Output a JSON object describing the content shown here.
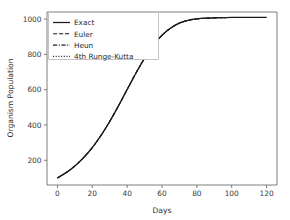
{
  "chart_data": {
    "type": "line",
    "title": "",
    "xlabel": "Days",
    "ylabel": "Organism Population",
    "xlim": [
      -6,
      126
    ],
    "ylim": [
      60,
      1040
    ],
    "xticks": [
      0,
      20,
      40,
      60,
      80,
      100,
      120
    ],
    "xtick_labels": [
      "0",
      "20",
      "40",
      "60",
      "80",
      "100",
      "120"
    ],
    "yticks": [
      200,
      400,
      600,
      800,
      1000
    ],
    "ytick_labels": [
      "200",
      "400",
      "600",
      "800",
      "1000"
    ],
    "grid": false,
    "legend_position": "upper left",
    "line_color": "#1c1c1c",
    "x": [
      0,
      5,
      10,
      15,
      20,
      25,
      30,
      35,
      40,
      45,
      50,
      55,
      60,
      65,
      70,
      75,
      80,
      85,
      90,
      95,
      100,
      105,
      110,
      115,
      120
    ],
    "series": [
      {
        "name": "Exact",
        "linestyle": "solid",
        "values": [
          100,
          130,
          168,
          215,
          272,
          341,
          420,
          508,
          601,
          693,
          778,
          851,
          908,
          949,
          977,
          993,
          1001,
          1005,
          1007,
          1008,
          1009,
          1009,
          1009,
          1009,
          1009
        ]
      },
      {
        "name": "Euler",
        "linestyle": "dashed",
        "values": [
          100,
          130,
          168,
          215,
          272,
          341,
          420,
          508,
          601,
          693,
          778,
          851,
          908,
          949,
          977,
          993,
          1001,
          1005,
          1007,
          1008,
          1009,
          1009,
          1009,
          1009,
          1009
        ]
      },
      {
        "name": "Heun",
        "linestyle": "dashdot",
        "values": [
          100,
          130,
          168,
          215,
          272,
          341,
          420,
          508,
          601,
          693,
          778,
          851,
          908,
          949,
          977,
          993,
          1001,
          1005,
          1007,
          1008,
          1009,
          1009,
          1009,
          1009,
          1009
        ]
      },
      {
        "name": "4th Runge-Kutta",
        "linestyle": "dotted",
        "values": [
          100,
          130,
          168,
          215,
          272,
          341,
          420,
          508,
          601,
          693,
          778,
          851,
          908,
          949,
          977,
          993,
          1001,
          1005,
          1007,
          1008,
          1009,
          1009,
          1009,
          1009,
          1009
        ]
      }
    ]
  },
  "legend": {
    "entries": [
      {
        "label": "Exact"
      },
      {
        "label": "Euler"
      },
      {
        "label": "Heun"
      },
      {
        "label": "4th Runge-Kutta"
      }
    ]
  }
}
